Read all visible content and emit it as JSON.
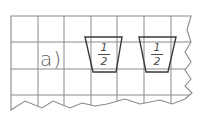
{
  "worksheet": {
    "task_label": "a)",
    "cups": [
      {
        "numerator": "1",
        "denominator": "2"
      },
      {
        "numerator": "1",
        "denominator": "2"
      }
    ]
  },
  "colors": {
    "grid": "#8a8a8a",
    "cup_outline": "#3a3a3a",
    "text": "#5a5a5a",
    "background": "#ffffff"
  }
}
